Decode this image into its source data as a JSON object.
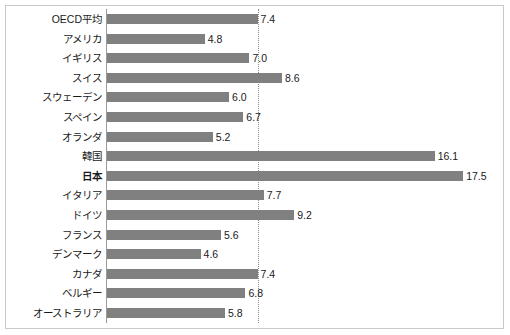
{
  "chart_data": {
    "type": "bar",
    "orientation": "horizontal",
    "title": "",
    "subtitle": "",
    "xlabel": "",
    "ylabel": "",
    "xlim": [
      0,
      19.8
    ],
    "grid": false,
    "legend": null,
    "bar_color": "#808080",
    "background_color": "#ffffff",
    "frame_color": "#c9c9c9",
    "axis_color": "#9a9a9a",
    "reference_line": {
      "value": 7.4,
      "style": "dotted",
      "color": "#8c8c8c",
      "label": ""
    },
    "categories": [
      "OECD平均",
      "アメリカ",
      "イギリス",
      "スイス",
      "スウェーデン",
      "スペイン",
      "オランダ",
      "韓国",
      "日本",
      "イタリア",
      "ドイツ",
      "フランス",
      "デンマーク",
      "カナダ",
      "ベルギー",
      "オーストラリア"
    ],
    "values": [
      7.4,
      4.8,
      7.0,
      8.6,
      6.0,
      6.7,
      5.2,
      16.1,
      17.5,
      7.7,
      9.2,
      5.6,
      4.6,
      7.4,
      6.8,
      5.8
    ],
    "value_labels": [
      "7.4",
      "4.8",
      "7.0",
      "8.6",
      "6.0",
      "6.7",
      "5.2",
      "16.1",
      "17.5",
      "7.7",
      "9.2",
      "5.6",
      "4.6",
      "7.4",
      "6.8",
      "5.8"
    ],
    "highlighted_categories": [
      "日本"
    ]
  }
}
